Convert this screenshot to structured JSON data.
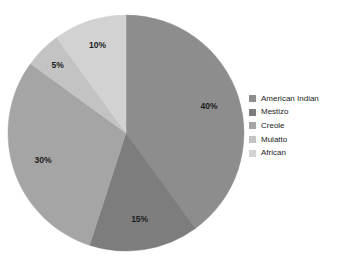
{
  "chart_data": {
    "type": "pie",
    "title": "",
    "categories": [
      "American Indian",
      "Mestizo",
      "Creole",
      "Mulatto",
      "African"
    ],
    "values": [
      40,
      15,
      30,
      5,
      10
    ],
    "value_labels": [
      "40%",
      "15%",
      "30%",
      "5%",
      "10%"
    ],
    "unit": "percent",
    "start_angle_deg": 0,
    "direction": "clockwise",
    "legend_position": "right",
    "grid": false,
    "colors": [
      "#8d8d8d",
      "#7d7d7d",
      "#a5a5a5",
      "#c3c3c3",
      "#d2d2d2"
    ],
    "slices": [
      {
        "label": "American Indian",
        "value": 40,
        "value_label": "40%",
        "color": "#8d8d8d"
      },
      {
        "label": "Mestizo",
        "value": 15,
        "value_label": "15%",
        "color": "#7d7d7d"
      },
      {
        "label": "Creole",
        "value": 30,
        "value_label": "30%",
        "color": "#a5a5a5"
      },
      {
        "label": "Mulatto",
        "value": 5,
        "value_label": "5%",
        "color": "#c3c3c3"
      },
      {
        "label": "African",
        "value": 10,
        "value_label": "10%",
        "color": "#d2d2d2"
      }
    ]
  },
  "legend": {
    "items": [
      {
        "label": "American Indian",
        "color": "#8d8d8d"
      },
      {
        "label": "Mestizo",
        "color": "#7d7d7d"
      },
      {
        "label": "Creole",
        "color": "#a5a5a5"
      },
      {
        "label": "Mulatto",
        "color": "#c3c3c3"
      },
      {
        "label": "African",
        "color": "#d2d2d2"
      }
    ]
  },
  "background_color": "#ffffff",
  "label_color": "#1c1c1c"
}
